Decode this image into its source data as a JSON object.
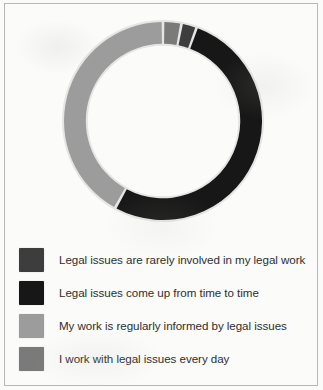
{
  "figure": {
    "background_color": "#fbfbfa",
    "border_color": "#b8b8b6"
  },
  "chart_data": {
    "type": "pie",
    "variant": "donut",
    "title": "",
    "subtitle": "",
    "xlabel": "",
    "ylabel": "",
    "grid": false,
    "legend_position": "bottom",
    "data_labels_shown": false,
    "start_angle_deg": 0,
    "direction": "clockwise",
    "hole_ratio": 0.78,
    "categories": [
      "Legal issues are rarely involved in my legal work",
      "Legal issues come up from time to time",
      "My work is regularly informed by legal issues",
      "I work with legal issues every day"
    ],
    "values": [
      2.5,
      52.5,
      42.0,
      3.0
    ],
    "units": "percent",
    "colors": [
      "#3d3d3d",
      "#171717",
      "#9c9c9c",
      "#7a7a7a"
    ],
    "slices": [
      {
        "label": "I work with legal issues every day",
        "value": 3.0,
        "color": "#7a7a7a",
        "start_deg": 0,
        "end_deg": 10.8
      },
      {
        "label": "Legal issues are rarely involved in my legal work",
        "value": 2.5,
        "color": "#3d3d3d",
        "start_deg": 10.8,
        "end_deg": 19.8
      },
      {
        "label": "Legal issues come up from time to time",
        "value": 52.5,
        "color": "#171717",
        "start_deg": 19.8,
        "end_deg": 208.8
      },
      {
        "label": "My work is regularly informed by legal issues",
        "value": 42.0,
        "color": "#9c9c9c",
        "start_deg": 208.8,
        "end_deg": 360
      }
    ]
  },
  "legend": {
    "items": [
      {
        "label": "Legal issues are rarely involved in my legal work",
        "color": "#3d3d3d"
      },
      {
        "label": "Legal issues come up from time to time",
        "color": "#171717"
      },
      {
        "label": "My work is regularly informed by legal issues",
        "color": "#9c9c9c"
      },
      {
        "label": "I work with legal issues every day",
        "color": "#7a7a7a"
      }
    ]
  }
}
